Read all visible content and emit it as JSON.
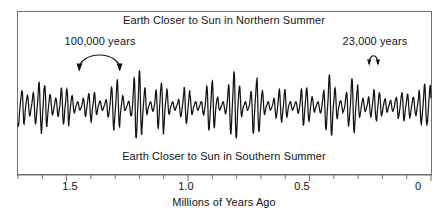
{
  "figure": {
    "background_color": "#ffffff",
    "ink_color": "#141414",
    "frame_color": "#6f6f6f"
  },
  "chart_data": {
    "type": "line",
    "title": "",
    "xlabel": "Millions of Years Ago",
    "ylabel": "",
    "xlim": [
      1.7,
      0.0
    ],
    "ylim": [
      -1.0,
      1.0
    ],
    "x_axis_reversed": true,
    "grid": false,
    "legend_position": "none",
    "tick_labels": [
      "1.5",
      "1.0",
      "0.5",
      "0"
    ],
    "tick_values": [
      1.5,
      1.0,
      0.5,
      0.0
    ],
    "minor_tick_interval": 0.1,
    "series": [
      {
        "name": "Precession index (Earth-Sun distance at Northern summer)",
        "description": "High-frequency ~23,000-year precession oscillation amplitude-modulated by the ~100,000-year eccentricity cycle",
        "carrier_period_years": 23000,
        "modulation_periods_years": [
          100000,
          413000
        ],
        "sample_interval_years": 1000,
        "x_start": 1.7,
        "x_end": 0.0
      }
    ],
    "upper_region_label": "Earth Closer to Sun in Northern Summer",
    "lower_region_label": "Earth Closer to Sun in Southern Summer",
    "annotations": [
      {
        "id": "cycle-100k",
        "text": "100,000 years",
        "marker": "double-headed-arc",
        "span_x_start": 1.435,
        "span_x_end": 1.255
      },
      {
        "id": "cycle-23k",
        "text": "23,000 years",
        "marker": "double-headed-arc",
        "span_x_start": 0.215,
        "span_x_end": 0.172
      }
    ]
  },
  "labels": {
    "title_north": "Earth Closer to Sun in Northern Summer",
    "title_south": "Earth Closer to Sun in Southern Summer",
    "axis_title": "Millions of Years Ago",
    "annotation_100k": "100,000 years",
    "annotation_23k": "23,000 years",
    "tick_1_5": "1.5",
    "tick_1_0": "1.0",
    "tick_0_5": "0.5",
    "tick_0": "0"
  }
}
